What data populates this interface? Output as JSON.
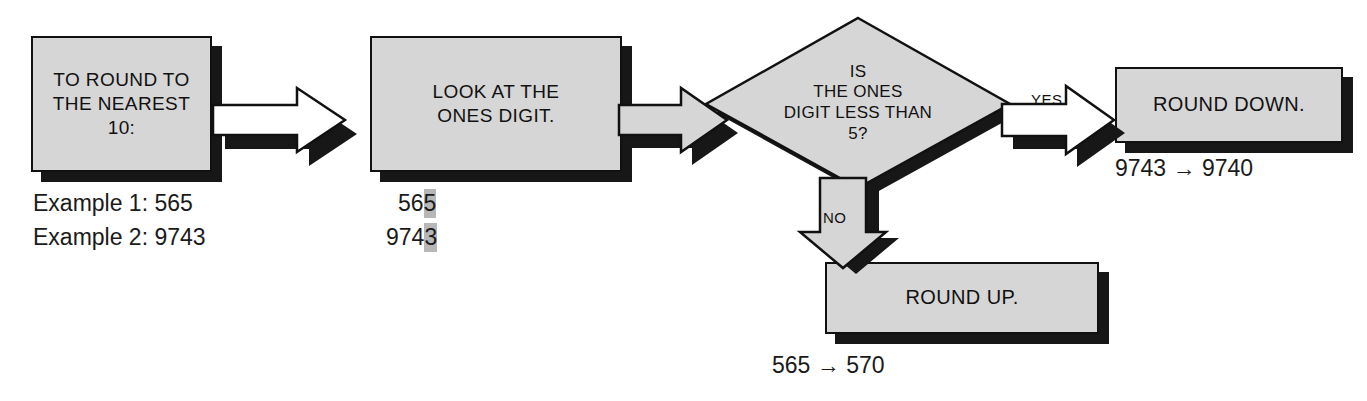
{
  "diagram": {
    "colors": {
      "node_fill": "#d6d6d6",
      "node_border": "#111111",
      "shadow": "#171717",
      "arrow_white_fill": "#ffffff",
      "arrow_gray_fill": "#d6d6d6",
      "highlight": "#b7b7b7",
      "background": "#ffffff"
    },
    "nodes": [
      {
        "id": "start",
        "type": "process",
        "lines": [
          "TO ROUND TO",
          "THE NEAREST 10:"
        ]
      },
      {
        "id": "look",
        "type": "process",
        "lines": [
          "LOOK AT THE",
          "ONES DIGIT."
        ]
      },
      {
        "id": "decision",
        "type": "decision",
        "lines": [
          "IS",
          "THE ONES",
          "DIGIT  LESS THAN",
          "5?"
        ]
      },
      {
        "id": "round_down",
        "type": "process",
        "lines": [
          "ROUND DOWN."
        ]
      },
      {
        "id": "round_up",
        "type": "process",
        "lines": [
          "ROUND UP."
        ]
      }
    ],
    "edges": [
      {
        "id": "start-to-look",
        "label": "",
        "style": "white"
      },
      {
        "id": "look-to-decision",
        "label": "",
        "style": "gray"
      },
      {
        "id": "decision-to-down",
        "label": "YES",
        "style": "white"
      },
      {
        "id": "decision-to-up",
        "label": "NO",
        "style": "gray"
      }
    ],
    "captions": {
      "example_1": "Example 1: 565",
      "example_2": "Example 2: 9743",
      "ones_digit_1_prefix": "56",
      "ones_digit_1_highlight": "5",
      "ones_digit_2_prefix": "974",
      "ones_digit_2_highlight": "3",
      "result_down": "9743 → 9740",
      "result_up": "565 → 570"
    }
  }
}
